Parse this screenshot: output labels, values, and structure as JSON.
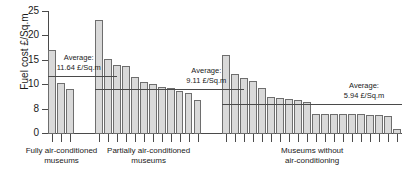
{
  "chart_data": {
    "type": "bar",
    "title": "",
    "xlabel": "",
    "ylabel": "Fuel cost £/Sq.m",
    "ylim": [
      0,
      25
    ],
    "yticks": [
      0,
      5,
      10,
      15,
      20,
      25
    ],
    "ytick_labels": [
      "0",
      "8",
      "10",
      "15",
      "20",
      "25"
    ],
    "grid": false,
    "legend": "none",
    "groups": [
      {
        "name": "Fully air-conditioned museums",
        "label_line1": "Fully air-conditioned",
        "label_line2": "museums",
        "values": [
          17.3,
          10.5,
          9.2
        ],
        "average": 11.64,
        "average_note_line1": "Average:",
        "average_note_line2": "11.64 £/Sq.m"
      },
      {
        "name": "Partially air-conditioned museums",
        "label_line1": "Partially air-conditioned",
        "label_line2": "museums",
        "values": [
          23.3,
          15.4,
          14.2,
          13.9,
          11.7,
          10.7,
          10.2,
          9.7,
          9.4,
          8.8,
          8.5,
          6.9
        ],
        "average": 9.11,
        "average_note_line1": "Average:",
        "average_note_line2": "9.11 £/Sq.m"
      },
      {
        "name": "Museums without air-conditioning",
        "label_line1": "Museums without",
        "label_line2": "air-conditioning",
        "values": [
          16.1,
          12.4,
          11.4,
          10.9,
          9.4,
          7.6,
          7.3,
          7.2,
          6.9,
          6.6,
          4.2,
          4.2,
          4.2,
          4.1,
          4.1,
          4.0,
          3.9,
          3.8,
          3.7,
          1.0
        ],
        "average": 5.94,
        "average_note_line1": "Average:",
        "average_note_line2": "5.94 £/Sq.m"
      }
    ],
    "colors": {
      "bar_fill": "#d9d9d9",
      "bar_stroke": "#6e6e6e",
      "axis": "#4a4a4a",
      "text": "#1a1a1a"
    }
  }
}
